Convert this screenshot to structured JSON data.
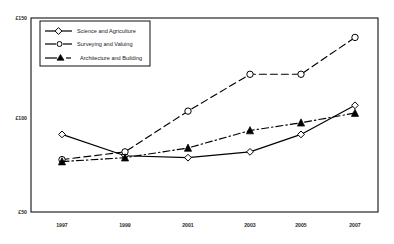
{
  "chart_data": {
    "type": "line",
    "title": "",
    "xlabel": "",
    "ylabel": "",
    "categories": [
      "1997",
      "1999",
      "2001",
      "2003",
      "2005",
      "2007"
    ],
    "x": [
      1997,
      1999,
      2001,
      2003,
      2005,
      2007
    ],
    "ylim": [
      50,
      150
    ],
    "yticks": [
      50,
      100,
      150
    ],
    "ytick_labels": [
      "£50",
      "£100",
      "£150"
    ],
    "grid": false,
    "legend_position": "top-left",
    "currency_symbol": "£",
    "series": [
      {
        "name": "Science and Agriculture",
        "marker": "diamond-open",
        "line_style": "solid",
        "color": "#000000",
        "values": [
          90,
          79,
          78,
          81,
          90,
          105
        ]
      },
      {
        "name": "Surveying and Valuing",
        "marker": "circle-open",
        "line_style": "dashed",
        "color": "#000000",
        "values": [
          77,
          81,
          102,
          121,
          121,
          140
        ]
      },
      {
        "name": "Architecture and Building",
        "marker": "triangle-filled",
        "line_style": "dash-dot",
        "color": "#000000",
        "values": [
          76,
          78,
          83,
          92,
          96,
          101
        ]
      }
    ]
  },
  "axis": {
    "y_top_label": "£150",
    "y_mid_label": "£100",
    "y_bottom_label": "£50",
    "x_labels": [
      "1997",
      "1999",
      "2001",
      "2003",
      "2005",
      "2007"
    ]
  },
  "legend": {
    "entries": [
      {
        "label": "Science and Agriculture"
      },
      {
        "label": "Surveying and Valuing"
      },
      {
        "label": "Architecture and Building"
      }
    ]
  }
}
